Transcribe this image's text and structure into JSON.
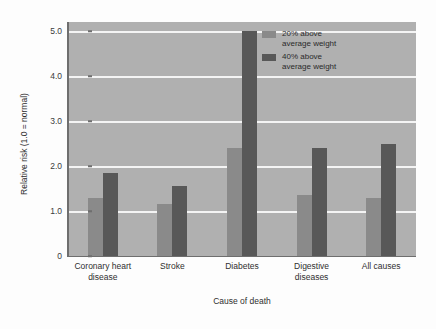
{
  "chart_data": {
    "type": "bar",
    "title": "",
    "xlabel": "Cause of death",
    "ylabel": "Relative risk (1.0 = normal)",
    "categories": [
      "Coronary heart disease",
      "Stroke",
      "Diabetes",
      "Digestive diseases",
      "All causes"
    ],
    "category_lines": [
      [
        "Coronary heart",
        "disease"
      ],
      [
        "Stroke",
        ""
      ],
      [
        "Diabetes",
        ""
      ],
      [
        "Digestive",
        "diseases"
      ],
      [
        "All causes",
        ""
      ]
    ],
    "series": [
      {
        "name": "20% above average weight",
        "name_lines": [
          "20% above",
          "average weight"
        ],
        "color": "#8a8a8a",
        "values": [
          1.3,
          1.15,
          2.4,
          1.35,
          1.3
        ]
      },
      {
        "name": "40% above average weight",
        "name_lines": [
          "40% above",
          "average weight"
        ],
        "color": "#585858",
        "values": [
          1.85,
          1.55,
          5.0,
          2.4,
          2.5
        ]
      }
    ],
    "ylim": [
      0,
      5.2
    ],
    "yticks": [
      0,
      1.0,
      2.0,
      3.0,
      4.0,
      5.0
    ],
    "ytick_labels": [
      "0",
      "1.0",
      "2.0",
      "3.0",
      "4.0",
      "5.0"
    ],
    "grid": true,
    "gridlines_at": [
      1.0,
      2.0,
      3.0,
      4.0,
      5.0
    ],
    "legend_position": "top-right",
    "plot_background": "#b0b0b0",
    "gridline_color": "#f4f4f4",
    "axis_color": "#6e6e6e"
  }
}
